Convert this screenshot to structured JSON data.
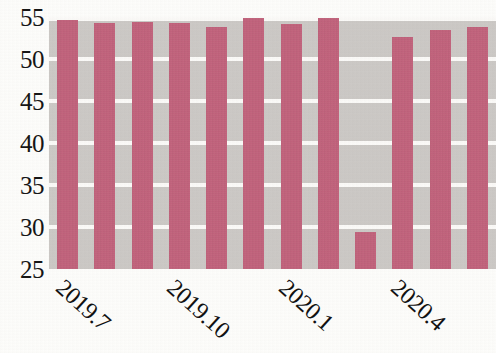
{
  "chart_data": {
    "type": "bar",
    "title": "",
    "subtitle": "",
    "xlabel": "",
    "ylabel": "",
    "ylim": [
      25,
      55
    ],
    "grid": true,
    "grid_axis": "y",
    "legend": null,
    "legend_position": "none",
    "bar_color": "#c2617b",
    "plot_background_color": "#ccc9c6",
    "gridline_color": "#fbfaf8",
    "axis_text_color": "#121212",
    "y_ticks": [
      25,
      30,
      35,
      40,
      45,
      50,
      55
    ],
    "y_tick_labels": [
      "25",
      "30",
      "35",
      "40",
      "45",
      "50",
      "55"
    ],
    "x_tick_labels": [
      "2019.7",
      "2019.10",
      "2020.1",
      "2020.4"
    ],
    "x_tick_label_rotation_deg": 42,
    "x_tick_label_indices": [
      0,
      3,
      6,
      9
    ],
    "categories": [
      "2019.7",
      "2019.8",
      "2019.9",
      "2019.10",
      "2019.11",
      "2019.12",
      "2020.1",
      "2020.2",
      "2020.3",
      "2020.4",
      "2020.5",
      "2020.6"
    ],
    "values": [
      54.6,
      54.3,
      54.4,
      54.3,
      53.8,
      54.9,
      54.2,
      54.9,
      29.4,
      52.6,
      53.4,
      53.8
    ],
    "bar_count": 12
  }
}
